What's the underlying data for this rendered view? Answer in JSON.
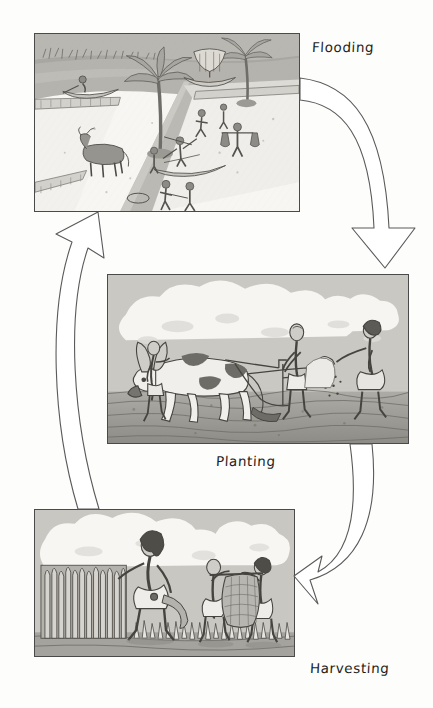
{
  "page": {
    "background_color": "#fdfdfb",
    "ink_color": "#3c3c3c",
    "width": 433,
    "height": 708
  },
  "labels": {
    "flooding": "Flooding",
    "planting": "Planting",
    "harvesting": "Harvesting"
  },
  "panels": [
    {
      "id": "flooding",
      "label": "Flooding",
      "caption_position": "top-right",
      "description": "Nile inundation scene: flooded fields and irrigation canals, tall palm trees, a reed sailing boat on the river, a small canoe with a rower, an ox standing in a field, workers wading through water, a man carrying a yoke with two water jars, and figures hauling a boat along the canal bank.",
      "x": 34,
      "y": 33,
      "width": 266,
      "height": 179
    },
    {
      "id": "planting",
      "label": "Planting",
      "caption_position": "bottom-center",
      "description": "Ploughing and sowing scene: a horned ox drawing a wooden ard plough guided by a farmer, led by a second man, while a sower walking behind scatters seed by hand over freshly turned furrows, beneath a clouded sky.",
      "x": 107,
      "y": 274,
      "width": 302,
      "height": 170
    },
    {
      "id": "harvesting",
      "label": "Harvesting",
      "caption_position": "bottom-right",
      "description": "Grain harvest scene: a farmer with a sickle and belt pouch gathers a large sheaf of standing wheat, while two workers behind him carry a woven basket of cut grain on their shoulders through the stubble field.",
      "x": 34,
      "y": 509,
      "width": 261,
      "height": 148
    }
  ],
  "arrows": [
    {
      "id": "flooding-to-planting",
      "from": "flooding",
      "to": "planting",
      "style": "hollow-outline-curve",
      "direction": "down",
      "note": "curves right and down from the Flooding panel to the Planting panel"
    },
    {
      "id": "planting-to-harvesting",
      "from": "planting",
      "to": "harvesting",
      "style": "hollow-outline-curve",
      "direction": "down-left",
      "note": "curves down and left from the Planting panel to the Harvesting panel"
    },
    {
      "id": "harvesting-to-flooding",
      "from": "harvesting",
      "to": "flooding",
      "style": "hollow-outline-curve",
      "direction": "up",
      "note": "curves up the left side from the Harvesting panel back to the Flooding panel, closing the cycle"
    }
  ]
}
